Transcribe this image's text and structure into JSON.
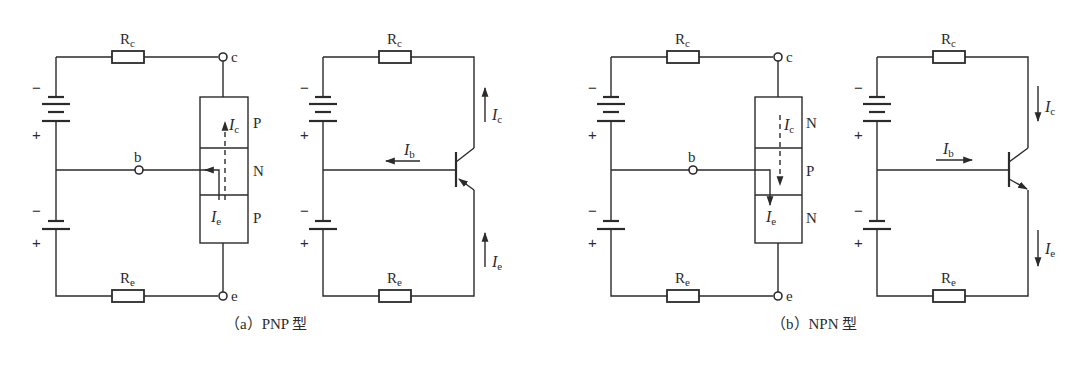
{
  "figure": {
    "panels": [
      {
        "id": "a",
        "caption": "（a）PNP 型",
        "type": "PNP",
        "layers": [
          "P",
          "N",
          "P"
        ],
        "terminals": {
          "collector": "c",
          "base": "b",
          "emitter": "e"
        },
        "resistors": {
          "top": {
            "name": "R",
            "sub": "c"
          },
          "bottom": {
            "name": "R",
            "sub": "e"
          }
        },
        "currents": {
          "collector": {
            "name": "I",
            "sub": "c",
            "direction": "up"
          },
          "emitter": {
            "name": "I",
            "sub": "e",
            "direction": "up"
          },
          "base": {
            "name": "I",
            "sub": "b",
            "direction": "left"
          }
        },
        "battery_signs": {
          "minus": "−",
          "plus": "+"
        }
      },
      {
        "id": "b",
        "caption": "（b）NPN 型",
        "type": "NPN",
        "layers": [
          "N",
          "P",
          "N"
        ],
        "terminals": {
          "collector": "c",
          "base": "b",
          "emitter": "e"
        },
        "resistors": {
          "top": {
            "name": "R",
            "sub": "c"
          },
          "bottom": {
            "name": "R",
            "sub": "e"
          }
        },
        "currents": {
          "collector": {
            "name": "I",
            "sub": "c",
            "direction": "down"
          },
          "emitter": {
            "name": "I",
            "sub": "e",
            "direction": "down"
          },
          "base": {
            "name": "I",
            "sub": "b",
            "direction": "right"
          }
        },
        "battery_signs": {
          "minus": "−",
          "plus": "+"
        }
      }
    ],
    "colors": {
      "ink": "#2b2b2b",
      "background": "#ffffff"
    }
  }
}
